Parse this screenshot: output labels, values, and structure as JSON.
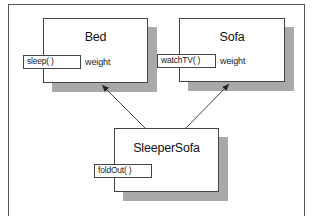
{
  "diagram": {
    "type": "class-inheritance",
    "classes": [
      {
        "name": "Bed",
        "method": "sleep( )",
        "attribute": "weight"
      },
      {
        "name": "Sofa",
        "method": "watchTV( )",
        "attribute": "weight"
      },
      {
        "name": "SleeperSofa",
        "method": "foldOut( )",
        "attribute": ""
      }
    ],
    "relationships": [
      {
        "from": "SleeperSofa",
        "to": "Bed",
        "kind": "inherits"
      },
      {
        "from": "SleeperSofa",
        "to": "Sofa",
        "kind": "inherits"
      }
    ],
    "colors": {
      "shadow": "#a9a9a9",
      "border": "#444444",
      "line": "#333333"
    }
  }
}
